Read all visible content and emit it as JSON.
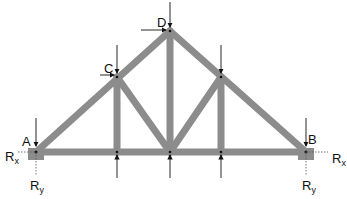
{
  "diagram": {
    "type": "truss",
    "member_color": "#8c8c8c",
    "nodes": {
      "A": {
        "label": "A",
        "x": 36,
        "y": 152
      },
      "B": {
        "label": "B",
        "x": 306,
        "y": 152
      },
      "C": {
        "label": "C",
        "x": 117,
        "y": 77
      },
      "D": {
        "label": "D",
        "x": 170,
        "y": 31
      },
      "E": {
        "label": "",
        "x": 221,
        "y": 77
      }
    },
    "reactions": {
      "left_x": "R",
      "left_x_sub": "x",
      "left_y": "R",
      "left_y_sub": "y",
      "right_x": "R",
      "right_x_sub": "x",
      "right_y": "R",
      "right_y_sub": "y"
    }
  }
}
